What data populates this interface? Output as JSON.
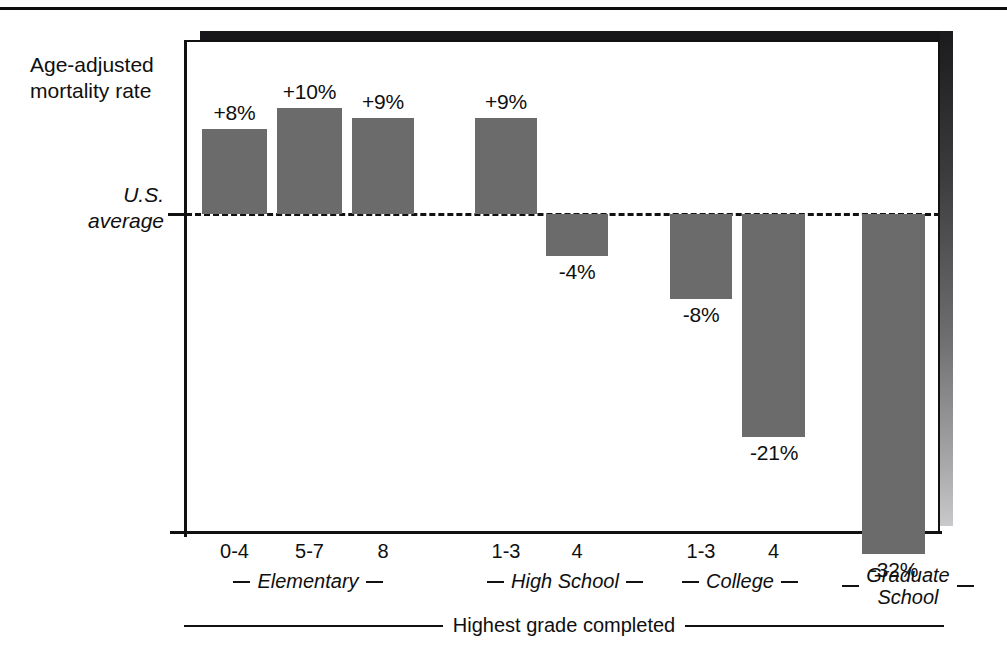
{
  "chart_data": {
    "type": "bar",
    "title": "",
    "ylabel": "Age-adjusted mortality rate",
    "xlabel": "Highest grade completed",
    "baseline_label_line1": "U.S.",
    "baseline_label_line2": "average",
    "baseline_value": 0,
    "unit": "%",
    "grid": false,
    "legend": "none",
    "ylim": [
      -34,
      12
    ],
    "categories": [
      "0-4",
      "5-7",
      "8",
      "1-3",
      "4",
      "1-3",
      "4",
      ""
    ],
    "values": [
      8,
      10,
      9,
      9,
      -4,
      -8,
      -21,
      -32
    ],
    "value_labels": [
      "+8%",
      "+10%",
      "+9%",
      "+9%",
      "-4%",
      "-8%",
      "-21%",
      "-32%"
    ],
    "groups": [
      {
        "label": "Elementary",
        "categories": [
          "0-4",
          "5-7",
          "8"
        ]
      },
      {
        "label": "High School",
        "categories": [
          "1-3",
          "4"
        ]
      },
      {
        "label": "College",
        "categories": [
          "1-3",
          "4"
        ]
      },
      {
        "label": "Graduate School",
        "label_line1": "Graduate",
        "label_line2": "School",
        "categories": [
          ""
        ]
      }
    ],
    "bar_color": "#6b6b6b",
    "axis_color": "#111111"
  },
  "bars": [
    {
      "id": "elementary-0-4",
      "tick": "0-4",
      "label": "+8%",
      "value": 8,
      "x": 202,
      "w": 65,
      "label_x": 202,
      "label_w": 65
    },
    {
      "id": "elementary-5-7",
      "tick": "5-7",
      "label": "+10%",
      "value": 10,
      "x": 277,
      "w": 65,
      "label_x": 272,
      "label_w": 75
    },
    {
      "id": "elementary-8",
      "tick": "8",
      "label": "+9%",
      "value": 9,
      "x": 352,
      "w": 62,
      "label_x": 350,
      "label_w": 66
    },
    {
      "id": "highschool-1-3",
      "tick": "1-3",
      "label": "+9%",
      "value": 9,
      "x": 475,
      "w": 62,
      "label_x": 473,
      "label_w": 66
    },
    {
      "id": "highschool-4",
      "tick": "4",
      "label": "-4%",
      "value": -4,
      "x": 546,
      "w": 62,
      "label_x": 544,
      "label_w": 66
    },
    {
      "id": "college-1-3",
      "tick": "1-3",
      "label": "-8%",
      "value": -8,
      "x": 670,
      "w": 62,
      "label_x": 668,
      "label_w": 66
    },
    {
      "id": "college-4",
      "tick": "4",
      "label": "-21%",
      "value": -21,
      "x": 742,
      "w": 63,
      "label_x": 737,
      "label_w": 74
    },
    {
      "id": "graduate-school",
      "tick": "",
      "label": "-32%",
      "value": -32,
      "x": 862,
      "w": 63,
      "label_x": 857,
      "label_w": 74
    }
  ],
  "ticks": [
    {
      "text": "0-4",
      "x": 202,
      "w": 65
    },
    {
      "text": "5-7",
      "x": 277,
      "w": 65
    },
    {
      "text": "8",
      "x": 352,
      "w": 62
    },
    {
      "text": "1-3",
      "x": 475,
      "w": 62
    },
    {
      "text": "4",
      "x": 546,
      "w": 62
    },
    {
      "text": "1-3",
      "x": 670,
      "w": 62
    },
    {
      "text": "4",
      "x": 742,
      "w": 63
    }
  ],
  "group_labels": [
    {
      "text": "Elementary",
      "x": 198,
      "w": 220,
      "two_line": false
    },
    {
      "text": "High School",
      "x": 455,
      "w": 220,
      "two_line": false
    },
    {
      "text": "College",
      "x": 640,
      "w": 200,
      "two_line": false
    },
    {
      "text": "Graduate School",
      "line1": "Graduate",
      "line2": "School",
      "x": 818,
      "w": 180,
      "two_line": true
    }
  ],
  "axis_title": "Highest grade completed"
}
